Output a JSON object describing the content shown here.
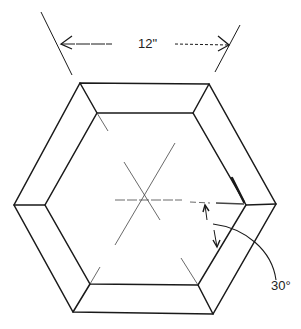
{
  "diagram": {
    "type": "technical-drawing",
    "dimension_label": "12\"",
    "angle_label": "30°",
    "stroke_color": "#1a1a1a",
    "background": "#ffffff"
  }
}
